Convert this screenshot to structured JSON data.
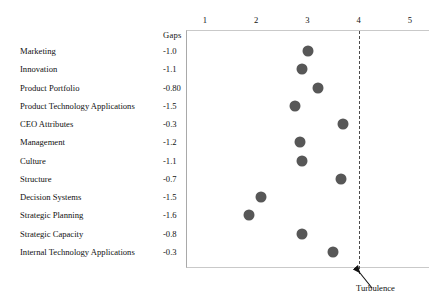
{
  "chart_data": {
    "type": "scatter",
    "title": "",
    "xlabel": "",
    "ylabel": "",
    "xlim": [
      0.6,
      5.0
    ],
    "xticks": [
      1,
      2,
      3,
      4,
      5
    ],
    "xtick_labels": [
      "1",
      "2",
      "3",
      "4",
      "5"
    ],
    "grid": false,
    "legend": false,
    "gaps_column_header": "Gaps",
    "threshold": {
      "value": 4,
      "label": "Turbulence",
      "style": "dashed-vertical"
    },
    "marker": {
      "shape": "circle",
      "color": "#575757",
      "size_px": 11
    },
    "categories": [
      "Marketing",
      "Innovation",
      "Product Portfolio",
      "Product Technology Applications",
      "CEO Attributes",
      "Management",
      "Culture",
      "Structure",
      "Decision Systems",
      "Strategic Planning",
      "Strategic Capacity",
      "Internal Technology Applications"
    ],
    "gaps": [
      "-1.0",
      "-1.1",
      "-0.80",
      "-1.5",
      "-0.3",
      "-1.2",
      "-1.1",
      "-0.7",
      "-1.5",
      "-1.6",
      "-0.8",
      "-0.3"
    ],
    "values": [
      3.0,
      2.9,
      3.2,
      2.75,
      3.7,
      2.85,
      2.9,
      3.65,
      2.1,
      1.85,
      2.9,
      3.5
    ],
    "points": [
      {
        "label": "Marketing",
        "gap": "-1.0",
        "value": 3.0
      },
      {
        "label": "Innovation",
        "gap": "-1.1",
        "value": 2.9
      },
      {
        "label": "Product Portfolio",
        "gap": "-0.80",
        "value": 3.2
      },
      {
        "label": "Product Technology Applications",
        "gap": "-1.5",
        "value": 2.75
      },
      {
        "label": "CEO Attributes",
        "gap": "-0.3",
        "value": 3.7
      },
      {
        "label": "Management",
        "gap": "-1.2",
        "value": 2.85
      },
      {
        "label": "Culture",
        "gap": "-1.1",
        "value": 2.9
      },
      {
        "label": "Structure",
        "gap": "-0.7",
        "value": 3.65
      },
      {
        "label": "Decision Systems",
        "gap": "-1.5",
        "value": 2.1
      },
      {
        "label": "Strategic Planning",
        "gap": "-1.6",
        "value": 1.85
      },
      {
        "label": "Strategic Capacity",
        "gap": "-0.8",
        "value": 2.9
      },
      {
        "label": "Internal Technology Applications",
        "gap": "-0.3",
        "value": 3.5
      }
    ]
  }
}
